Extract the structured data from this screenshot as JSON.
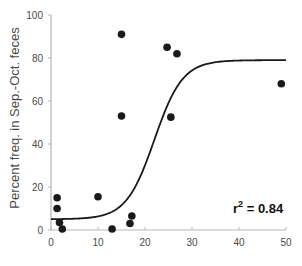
{
  "chart_data": {
    "type": "scatter",
    "title": "",
    "xlabel": "",
    "ylabel": "Percent freq. in Sep.-Oct. feces",
    "xlim": [
      0,
      50
    ],
    "ylim": [
      0,
      100
    ],
    "xticks": [
      0,
      10,
      20,
      30,
      40,
      50
    ],
    "yticks": [
      0,
      20,
      40,
      60,
      80,
      100
    ],
    "grid": false,
    "legend": null,
    "series": [
      {
        "name": "observations",
        "type": "scatter",
        "marker_color": "#1a1a1a",
        "points": [
          {
            "x": 1.3,
            "y": 15
          },
          {
            "x": 1.3,
            "y": 10
          },
          {
            "x": 1.8,
            "y": 3.5
          },
          {
            "x": 2.4,
            "y": 0.5
          },
          {
            "x": 10,
            "y": 15.5
          },
          {
            "x": 13,
            "y": 0.5
          },
          {
            "x": 15,
            "y": 91
          },
          {
            "x": 15,
            "y": 53
          },
          {
            "x": 16.8,
            "y": 3
          },
          {
            "x": 17.2,
            "y": 6.5
          },
          {
            "x": 24.7,
            "y": 85
          },
          {
            "x": 26.8,
            "y": 82
          },
          {
            "x": 25.5,
            "y": 52.5
          },
          {
            "x": 49,
            "y": 68
          }
        ]
      },
      {
        "name": "logistic fit",
        "type": "line",
        "line_color": "#1a1a1a",
        "model": {
          "lower": 5,
          "upper": 79,
          "midpoint": 22,
          "scale": 3
        },
        "x_range": [
          0,
          50
        ]
      }
    ],
    "annotations": [
      {
        "text": "r² = 0.84",
        "x": 42,
        "y": 10,
        "bold": true
      }
    ]
  },
  "labels": {
    "ylabel": "Percent freq. in Sep.-Oct. feces",
    "r2_prefix": "r",
    "r2_sup": "2",
    "r2_value": " = 0.84"
  }
}
